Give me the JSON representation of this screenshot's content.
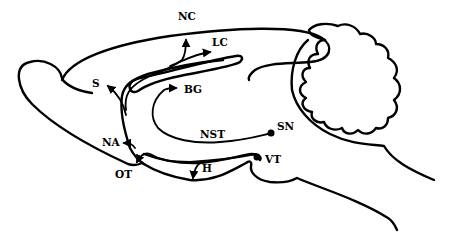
{
  "figure": {
    "labels": {
      "nc": "NC",
      "lc": "LC",
      "s": "S",
      "bg": "BG",
      "nst": "NST",
      "sn": "SN",
      "na": "NA",
      "ot": "OT",
      "h": "H",
      "vt": "VT"
    },
    "colors": {
      "stroke": "#000000",
      "background": "#ffffff"
    }
  }
}
